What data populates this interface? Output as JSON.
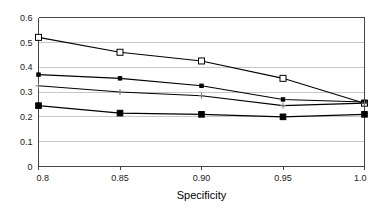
{
  "chart_data": {
    "type": "line",
    "title": "",
    "subtitle": "",
    "xlabel": "Specificity",
    "ylabel": "",
    "x": [
      0.8,
      0.85,
      0.9,
      0.95,
      1.0
    ],
    "xtick_labels": [
      "0.8",
      "0.85",
      "0.90",
      "0.95",
      "1.0"
    ],
    "ytick_labels": [
      "0",
      "0.1",
      "0.2",
      "0.3",
      "0.4",
      "0.5",
      "0.6"
    ],
    "yticks": [
      0,
      0.1,
      0.2,
      0.3,
      0.4,
      0.5,
      0.6
    ],
    "xlim": [
      0.8,
      1.0
    ],
    "ylim": [
      0,
      0.6
    ],
    "grid": "horizontal",
    "legend": "none",
    "series": [
      {
        "name": "series-1",
        "marker": "open-square",
        "color": "#000000",
        "values": [
          0.52,
          0.46,
          0.425,
          0.355,
          0.255
        ]
      },
      {
        "name": "series-2",
        "marker": "filled-small-square",
        "color": "#000000",
        "values": [
          0.37,
          0.355,
          0.325,
          0.27,
          0.26
        ]
      },
      {
        "name": "series-3",
        "marker": "plus",
        "color": "#000000",
        "values": [
          0.325,
          0.3,
          0.285,
          0.245,
          0.255
        ]
      },
      {
        "name": "series-4",
        "marker": "filled-square",
        "color": "#000000",
        "values": [
          0.245,
          0.215,
          0.21,
          0.2,
          0.21
        ]
      }
    ]
  },
  "colors": {
    "axis": "#444444",
    "grid": "#c8c8c8",
    "line": "#000000",
    "text": "#111111",
    "background": "#ffffff"
  },
  "axis": {
    "x_title": "Specificity"
  }
}
